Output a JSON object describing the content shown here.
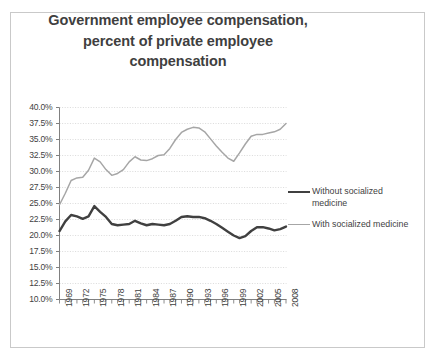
{
  "chart_data": {
    "type": "line",
    "title": "Government employee compensation, percent of private employee compensation",
    "title_lines": [
      "Government employee compensation,",
      "percent of private employee",
      "compensation"
    ],
    "xlabel": "",
    "ylabel": "",
    "grid": true,
    "legend_position": "right",
    "ylim": [
      10,
      40
    ],
    "ytick_labels": [
      "40.0%",
      "37.5%",
      "35.0%",
      "32.5%",
      "30.0%",
      "27.5%",
      "25.0%",
      "22.5%",
      "20.0%",
      "17.5%",
      "15.0%",
      "12.5%",
      "10.0%"
    ],
    "ytick_values": [
      40,
      37.5,
      35,
      32.5,
      30,
      27.5,
      25,
      22.5,
      20,
      17.5,
      15,
      12.5,
      10
    ],
    "xtick_labels": [
      "1969",
      "1972",
      "1975",
      "1978",
      "1981",
      "1984",
      "1987",
      "1990",
      "1993",
      "1996",
      "1999",
      "2002",
      "2005",
      "2008"
    ],
    "xtick_values": [
      1969,
      1972,
      1975,
      1978,
      1981,
      1984,
      1987,
      1990,
      1993,
      1996,
      1999,
      2002,
      2005,
      2008
    ],
    "x": [
      1969,
      1970,
      1971,
      1972,
      1973,
      1974,
      1975,
      1976,
      1977,
      1978,
      1979,
      1980,
      1981,
      1982,
      1983,
      1984,
      1985,
      1986,
      1987,
      1988,
      1989,
      1990,
      1991,
      1992,
      1993,
      1994,
      1995,
      1996,
      1997,
      1998,
      1999,
      2000,
      2001,
      2002,
      2003,
      2004,
      2005,
      2006,
      2007,
      2008
    ],
    "series": [
      {
        "name": "Without socialized medicine",
        "color": "#404040",
        "width": 2.4,
        "values": [
          20.7,
          22.2,
          23.2,
          23.0,
          22.6,
          23.0,
          24.6,
          23.7,
          22.9,
          21.8,
          21.6,
          21.7,
          21.8,
          22.3,
          21.9,
          21.6,
          21.8,
          21.7,
          21.6,
          21.8,
          22.3,
          22.9,
          23.0,
          22.9,
          22.9,
          22.7,
          22.3,
          21.8,
          21.2,
          20.6,
          20.0,
          19.6,
          19.9,
          20.7,
          21.3,
          21.3,
          21.1,
          20.8,
          21.0,
          21.4
        ]
      },
      {
        "name": "With socialized medicine",
        "color": "#a6a6a6",
        "width": 1.5,
        "values": [
          24.8,
          26.6,
          28.6,
          29.0,
          29.1,
          30.2,
          32.1,
          31.5,
          30.3,
          29.4,
          29.7,
          30.3,
          31.5,
          32.3,
          31.8,
          31.7,
          32.0,
          32.5,
          32.6,
          33.6,
          35.0,
          36.1,
          36.6,
          36.9,
          36.8,
          36.2,
          35.1,
          34.0,
          33.0,
          32.1,
          31.6,
          32.9,
          34.3,
          35.5,
          35.8,
          35.8,
          36.0,
          36.2,
          36.6,
          37.5
        ]
      }
    ]
  },
  "legend": {
    "items": [
      {
        "label_line1": "Without socialized",
        "label_line2": "medicine",
        "style": "dark"
      },
      {
        "label_line1": "With socialized medicine",
        "label_line2": "",
        "style": "light"
      }
    ]
  }
}
